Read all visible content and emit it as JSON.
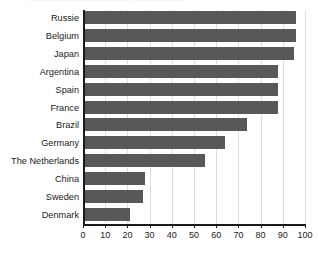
{
  "caption_fragment": "···· ·· ····· ········· ··········· ··· ········, ······ ········ ·········",
  "colors": {
    "bar": "#585858",
    "axis": "#1a1a1a",
    "gridline": "#dcdcdc",
    "background": "#ffffff",
    "text": "#1a1a1a"
  },
  "chart_data": {
    "type": "bar",
    "orientation": "horizontal",
    "title": "",
    "xlabel": "",
    "ylabel": "",
    "xlim": [
      0,
      100
    ],
    "ylim": null,
    "xticks": [
      0,
      10,
      20,
      30,
      40,
      50,
      60,
      70,
      80,
      90,
      100
    ],
    "xtick_labels": [
      "0",
      "10",
      "20",
      "30",
      "40",
      "50",
      "60",
      "70",
      "80",
      "90",
      "100"
    ],
    "grid": "vertical",
    "legend": null,
    "categories": [
      "Russie",
      "Belgium",
      "Japan",
      "Argentina",
      "Spain",
      "France",
      "Brazil",
      "Germany",
      "The Netherlands",
      "China",
      "Sweden",
      "Denmark"
    ],
    "values": [
      96,
      96,
      95,
      88,
      88,
      88,
      74,
      64,
      55,
      28,
      27,
      21
    ]
  }
}
